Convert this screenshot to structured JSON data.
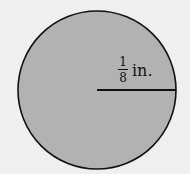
{
  "diagram": {
    "shape": "circle",
    "label": {
      "numerator": "1",
      "denominator": "8",
      "unit": "in."
    },
    "measurement": "radius",
    "colors": {
      "background": "#efefef",
      "fill": "#b2b2b2",
      "stroke": "#111111"
    }
  }
}
